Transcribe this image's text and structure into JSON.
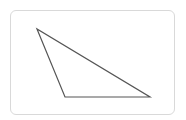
{
  "diagram": {
    "shape": "triangle",
    "stroke_color": "#555555",
    "border_color": "#d9d9d9",
    "vertices": [
      [
        37,
        29
      ],
      [
        65,
        97
      ],
      [
        150,
        97
      ]
    ]
  }
}
